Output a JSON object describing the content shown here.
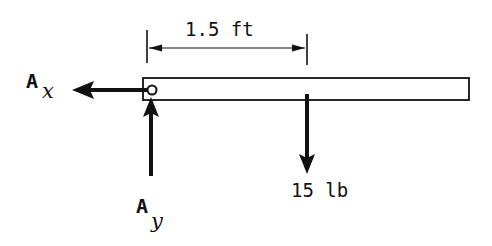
{
  "diagram": {
    "type": "free-body-diagram",
    "colors": {
      "ink": "#111111",
      "background": "#ffffff"
    },
    "beam": {
      "label": "beam"
    },
    "dimension": {
      "label": "1.5 ft",
      "value": 1.5,
      "unit": "ft"
    },
    "forces": [
      {
        "id": "Ax",
        "main": "A",
        "sub": "x",
        "direction": "left"
      },
      {
        "id": "Ay",
        "main": "A",
        "sub": "y",
        "direction": "up"
      },
      {
        "id": "load",
        "label": "15 lb",
        "value": 15,
        "unit": "lb",
        "direction": "down"
      }
    ],
    "support": {
      "type": "pin"
    }
  }
}
